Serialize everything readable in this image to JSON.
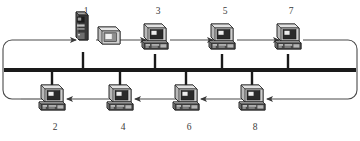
{
  "diagram": {
    "style": "monochrome-scanned",
    "colors": {
      "ink": "#2b2b2b",
      "bus": "#1a1a1a",
      "ring": "#4a4a4a",
      "label": "#3a3a3a",
      "screen_dark": "#2a2a2a",
      "screen_light": "#e8e8e8",
      "case_light": "#d8d8d8",
      "case_mid": "#9a9a9a",
      "case_dark": "#3c3c3c",
      "background": "#ffffff"
    },
    "bus": {
      "label": "network-bus",
      "y": 70,
      "x_start": 4,
      "x_end": 356,
      "thickness": 4
    },
    "ring": {
      "label": "ring-loop",
      "direction": "counterclockwise",
      "top_y": 40,
      "bottom_y": 99,
      "left_x": 12,
      "right_x": 348,
      "corner_radius": 9,
      "top_arrow_direction": "right",
      "bottom_arrow_direction": "left"
    },
    "nodes": [
      {
        "id": "node-1",
        "label": "1",
        "row": "top",
        "x": 83,
        "type": "tower-with-monitor",
        "label_x": 78,
        "label_y": 9
      },
      {
        "id": "node-3",
        "label": "3",
        "row": "top",
        "x": 155,
        "type": "desktop-pc",
        "label_x": 150,
        "label_y": 9
      },
      {
        "id": "node-5",
        "label": "5",
        "row": "top",
        "x": 222,
        "type": "desktop-pc",
        "label_x": 217,
        "label_y": 9
      },
      {
        "id": "node-7",
        "label": "7",
        "row": "top",
        "x": 288,
        "type": "desktop-pc",
        "label_x": 283,
        "label_y": 9
      },
      {
        "id": "node-2",
        "label": "2",
        "row": "bottom",
        "x": 52,
        "type": "desktop-pc",
        "label_x": 47,
        "label_y": 123
      },
      {
        "id": "node-4",
        "label": "4",
        "row": "bottom",
        "x": 120,
        "type": "desktop-pc",
        "label_x": 115,
        "label_y": 123
      },
      {
        "id": "node-6",
        "label": "6",
        "row": "bottom",
        "x": 186,
        "type": "desktop-pc",
        "label_x": 181,
        "label_y": 123
      },
      {
        "id": "node-8",
        "label": "8",
        "row": "bottom",
        "x": 252,
        "type": "desktop-pc",
        "label_x": 247,
        "label_y": 123
      }
    ]
  }
}
